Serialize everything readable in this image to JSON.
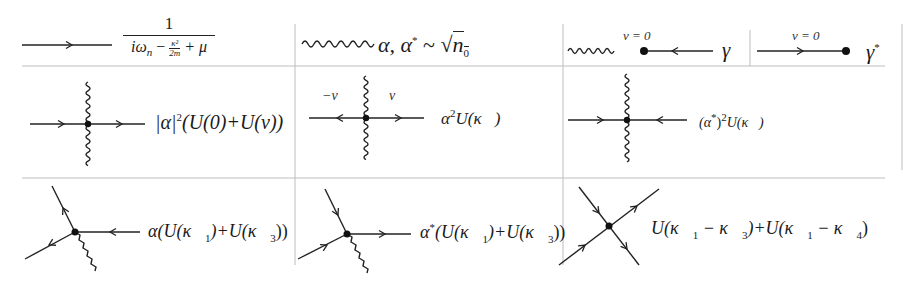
{
  "table": {
    "grid_color": "#bdbdbd",
    "line_color": "#222222",
    "rows": [
      {
        "cells": [
          {
            "diagram": "propagator-arrow-right",
            "expr_num": "1",
            "expr_den": "iω_n − κ²/2m + μ"
          },
          {
            "diagram": "wavy-line",
            "expr": "α, α* ~ √n₀"
          },
          {
            "diagram": "wavy-dot-arrow-left",
            "label_top": "ν = 0",
            "expr": "γ"
          },
          {
            "diagram": "arrow-right-dot",
            "label_top": "ν = 0",
            "expr": "γ*"
          }
        ]
      },
      {
        "cells": [
          {
            "diagram": "vertex-through-wavy-cross",
            "expr": "|α|²(U(0)+U(ν))"
          },
          {
            "diagram": "vertex-outgoing-pair",
            "label_left": "−ν",
            "label_right": "ν",
            "expr": "α²U(κ⃗)"
          },
          {
            "diagram": "vertex-incoming-pair",
            "expr": "(α*)²U(κ⃗)"
          }
        ]
      },
      {
        "cells": [
          {
            "diagram": "three-leg-vertex-in",
            "expr": "α(U(κ⃗₁)+U(κ⃗₃))"
          },
          {
            "diagram": "three-leg-vertex-out",
            "expr": "α*(U(κ⃗₁)+U(κ⃗₃))"
          },
          {
            "diagram": "four-leg-vertex",
            "expr": "U(κ⃗₁ − κ⃗₃)+U(κ⃗₁ − κ⃗₄)"
          }
        ]
      }
    ]
  },
  "text": {
    "r1c1_num": "1",
    "r1c1_den_a": "iω",
    "r1c1_den_n": "n",
    "r1c1_den_b": " − ",
    "r1c1_den_frac_num": "κ²",
    "r1c1_den_frac_den": "2m",
    "r1c1_den_c": " + μ",
    "r1c2_expr": "α, α",
    "r1c2_star": "*",
    "r1c2_tilde": " ~ ",
    "r1c2_sqrt": "√",
    "r1c2_n": "n",
    "r1c2_n_sub": "0",
    "nu_zero": "ν = 0",
    "gamma": "γ",
    "gamma_star": "*",
    "r2c1_a": "|α|",
    "r2c1_sq": "2",
    "r2c1_b": "(U(0)+U(ν))",
    "minus_nu": "−ν",
    "nu": "ν",
    "r2c2_a": "α",
    "r2c2_sq": "2",
    "r2c2_b": "U(κ⃗)",
    "r2c3_a": "(α",
    "r2c3_star": "*",
    "r2c3_b": ")",
    "r2c3_sq": "2",
    "r2c3_c": "U(κ⃗)",
    "r3c1_a": "α(U(κ⃗",
    "r3c1_s1": "1",
    "r3c1_b": ")+U(κ⃗",
    "r3c1_s3": "3",
    "r3c1_c": "))",
    "r3c2_a": "α",
    "r3c2_star": "*",
    "r3c2_b": "(U(κ⃗",
    "r3c2_s1": "1",
    "r3c2_c": ")+U(κ⃗",
    "r3c2_s3": "3",
    "r3c2_d": "))",
    "r3c3_a": "U(κ⃗",
    "r3c3_s1": "1",
    "r3c3_b": " − κ⃗",
    "r3c3_s3": "3",
    "r3c3_c": ")+U(κ⃗",
    "r3c3_s1b": "1",
    "r3c3_d": " − κ⃗",
    "r3c3_s4": "4",
    "r3c3_e": ")"
  }
}
